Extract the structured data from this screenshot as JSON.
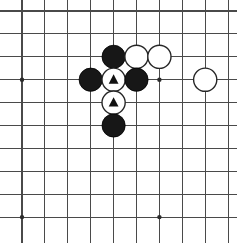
{
  "board": {
    "title": "Go board diagram",
    "type": "go-board-position",
    "grid": {
      "columns": 10,
      "rows": 10,
      "spacing_px": 22.9,
      "origin_x_px": 22,
      "origin_y_px": 11,
      "line_color": "#4a4a4a",
      "background_color": "#ffffff"
    },
    "star_points": [
      {
        "name": "star-point-upper-left",
        "col": 0,
        "row": 3
      },
      {
        "name": "star-point-upper-right",
        "col": 6,
        "row": 3
      },
      {
        "name": "star-point-lower-left",
        "col": 0,
        "row": 9
      },
      {
        "name": "star-point-lower-right",
        "col": 6,
        "row": 9
      }
    ],
    "stones": [
      {
        "name": "black-stone-e3",
        "color": "black",
        "col": 4,
        "row": 2,
        "marker": "none",
        "color_hex": "#171717"
      },
      {
        "name": "white-stone-f3",
        "color": "white",
        "col": 5,
        "row": 2,
        "marker": "none",
        "color_hex": "#ffffff"
      },
      {
        "name": "white-stone-g3",
        "color": "white",
        "col": 6,
        "row": 2,
        "marker": "none",
        "color_hex": "#ffffff"
      },
      {
        "name": "black-stone-d4",
        "color": "black",
        "col": 3,
        "row": 3,
        "marker": "none",
        "color_hex": "#171717"
      },
      {
        "name": "white-stone-e4-marked",
        "color": "white",
        "col": 4,
        "row": 3,
        "marker": "triangle",
        "color_hex": "#ffffff"
      },
      {
        "name": "black-stone-f4",
        "color": "black",
        "col": 5,
        "row": 3,
        "marker": "none",
        "color_hex": "#171717"
      },
      {
        "name": "white-stone-h4",
        "color": "white",
        "col": 8,
        "row": 3,
        "marker": "none",
        "color_hex": "#ffffff"
      },
      {
        "name": "white-stone-e5-marked",
        "color": "white",
        "col": 4,
        "row": 4,
        "marker": "triangle",
        "color_hex": "#ffffff"
      },
      {
        "name": "black-stone-e6",
        "color": "black",
        "col": 4,
        "row": 5,
        "marker": "none",
        "color_hex": "#171717"
      }
    ],
    "stone_radius_px": 11.6,
    "marker_label": "triangle"
  }
}
